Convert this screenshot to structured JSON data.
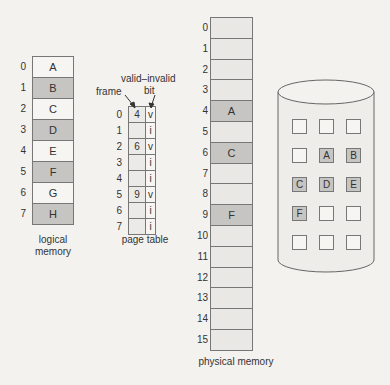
{
  "logical_memory": {
    "caption_line1": "logical",
    "caption_line2": "memory",
    "pages": [
      {
        "index": "0",
        "label": "A",
        "shaded": false
      },
      {
        "index": "1",
        "label": "B",
        "shaded": true
      },
      {
        "index": "2",
        "label": "C",
        "shaded": false
      },
      {
        "index": "3",
        "label": "D",
        "shaded": true
      },
      {
        "index": "4",
        "label": "E",
        "shaded": false
      },
      {
        "index": "5",
        "label": "F",
        "shaded": true
      },
      {
        "index": "6",
        "label": "G",
        "shaded": false
      },
      {
        "index": "7",
        "label": "H",
        "shaded": true
      }
    ]
  },
  "page_table": {
    "caption": "page table",
    "frame_label": "frame",
    "valid_label_line1": "valid–invalid",
    "valid_label_line2": "bit",
    "entries": [
      {
        "index": "0",
        "frame": "4",
        "bit": "v"
      },
      {
        "index": "1",
        "frame": "",
        "bit": "i"
      },
      {
        "index": "2",
        "frame": "6",
        "bit": "v"
      },
      {
        "index": "3",
        "frame": "",
        "bit": "i"
      },
      {
        "index": "4",
        "frame": "",
        "bit": "i"
      },
      {
        "index": "5",
        "frame": "9",
        "bit": "v"
      },
      {
        "index": "6",
        "frame": "",
        "bit": "i"
      },
      {
        "index": "7",
        "frame": "",
        "bit": "i"
      }
    ]
  },
  "physical_memory": {
    "caption": "physical memory",
    "frames": [
      {
        "index": "0",
        "label": ""
      },
      {
        "index": "1",
        "label": ""
      },
      {
        "index": "2",
        "label": ""
      },
      {
        "index": "3",
        "label": ""
      },
      {
        "index": "4",
        "label": "A"
      },
      {
        "index": "5",
        "label": ""
      },
      {
        "index": "6",
        "label": "C"
      },
      {
        "index": "7",
        "label": ""
      },
      {
        "index": "8",
        "label": ""
      },
      {
        "index": "9",
        "label": "F"
      },
      {
        "index": "10",
        "label": ""
      },
      {
        "index": "11",
        "label": ""
      },
      {
        "index": "12",
        "label": ""
      },
      {
        "index": "13",
        "label": ""
      },
      {
        "index": "14",
        "label": ""
      },
      {
        "index": "15",
        "label": ""
      }
    ]
  },
  "backing_store": {
    "grid": [
      [
        "",
        "",
        ""
      ],
      [
        "",
        "A",
        "B"
      ],
      [
        "C",
        "D",
        "E"
      ],
      [
        "F",
        "",
        ""
      ],
      [
        "",
        "",
        ""
      ]
    ]
  },
  "colors": {
    "shaded": "#c7c5c2",
    "plain": "#f6f5f2",
    "border": "#777777",
    "background": "#f3f2ef"
  }
}
